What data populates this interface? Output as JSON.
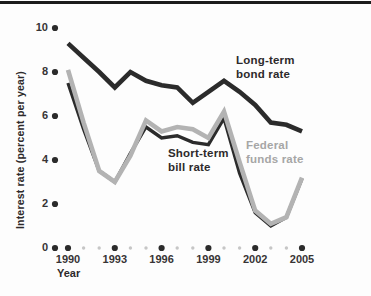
{
  "page": {
    "background": "#fdfdfd",
    "top_rule_color": "#1c1c1c"
  },
  "labels": {
    "long_term": {
      "line1": "Long-term",
      "line2": "bond rate"
    },
    "short_term": {
      "line1": "Short-term",
      "line2": "bill rate"
    },
    "federal": {
      "line1": "Federal",
      "line2": "funds rate"
    }
  },
  "chart_data": {
    "type": "line",
    "title": "",
    "xlabel": "Year",
    "ylabel": "Interest rate (percent per year)",
    "x": [
      1990,
      1991,
      1992,
      1993,
      1994,
      1995,
      1996,
      1997,
      1998,
      1999,
      2000,
      2001,
      2002,
      2003,
      2004,
      2005
    ],
    "series": [
      {
        "name": "Short-term bill rate",
        "color": "#2b2b2b",
        "width": 3.4,
        "values": [
          7.5,
          5.4,
          3.5,
          3.0,
          4.3,
          5.5,
          5.0,
          5.1,
          4.8,
          4.7,
          5.9,
          3.4,
          1.6,
          1.0,
          1.4,
          3.15
        ]
      },
      {
        "name": "Federal funds rate",
        "color": "#b3b3b3",
        "width": 4.6,
        "values": [
          8.1,
          5.7,
          3.5,
          3.0,
          4.2,
          5.8,
          5.3,
          5.5,
          5.4,
          5.0,
          6.2,
          3.9,
          1.7,
          1.1,
          1.4,
          3.2
        ]
      },
      {
        "name": "Long-term bond rate",
        "color": "#2b2b2b",
        "width": 4.6,
        "values": [
          9.3,
          8.65,
          8.0,
          7.3,
          8.0,
          7.6,
          7.4,
          7.3,
          6.6,
          7.1,
          7.6,
          7.1,
          6.5,
          5.7,
          5.6,
          5.3
        ]
      }
    ],
    "x_ticks_major": [
      1990,
      1993,
      1996,
      1999,
      2002,
      2005
    ],
    "y_ticks": [
      0,
      2,
      4,
      6,
      8,
      10
    ],
    "xlim": [
      1990,
      2005
    ],
    "ylim": [
      0,
      10
    ],
    "grid": false,
    "legend_position": "inline-annotations",
    "colors": {
      "dark": "#2b2b2b",
      "gray_line": "#b3b3b3",
      "gray_text": "#a6a6a6",
      "minor_dot": "#c6c6c6",
      "tick_text": "#373435"
    }
  }
}
